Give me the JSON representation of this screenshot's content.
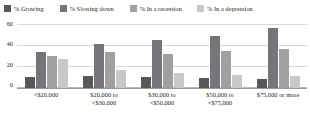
{
  "legend": {
    "items": [
      {
        "label": "% Growing",
        "color": "#58585a"
      },
      {
        "label": "% Slowing down",
        "color": "#76767a"
      },
      {
        "label": "% In a recession",
        "color": "#a0a0a2"
      },
      {
        "label": "% In a depression",
        "color": "#c8c8ca"
      }
    ]
  },
  "axis": {
    "yticks": [
      "0",
      "20",
      "40",
      "60"
    ]
  },
  "chart_data": {
    "type": "bar",
    "title": "",
    "xlabel": "",
    "ylabel": "",
    "ylim": [
      0,
      60
    ],
    "grid": true,
    "legend_position": "top",
    "categories": [
      "<$20,000",
      "$20,000 to <$30,000",
      "$30,000 to <$50,000",
      "$50,000 to <$75,000",
      "$75,000 or more"
    ],
    "category_lines": [
      [
        "<$20,000"
      ],
      [
        "$20,000 to",
        "<$30,000"
      ],
      [
        "$30,000 to",
        "<$50,000"
      ],
      [
        "$50,000 to",
        "<$75,000"
      ],
      [
        "$75,000 or more"
      ]
    ],
    "series": [
      {
        "name": "% Growing",
        "color": "#58585a",
        "values": [
          10,
          11,
          10,
          9,
          8
        ]
      },
      {
        "name": "% Slowing down",
        "color": "#76767a",
        "values": [
          34,
          41,
          45,
          49,
          56
        ]
      },
      {
        "name": "% In a recession",
        "color": "#a0a0a2",
        "values": [
          30,
          34,
          32,
          35,
          37
        ]
      },
      {
        "name": "% In a depression",
        "color": "#c8c8ca",
        "values": [
          27,
          17,
          14,
          12,
          11
        ]
      }
    ]
  }
}
